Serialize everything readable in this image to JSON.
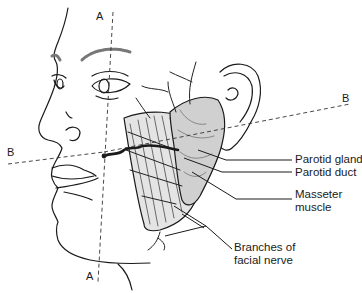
{
  "diagram": {
    "type": "anatomical-illustration",
    "reference_lines": [
      {
        "id": "A",
        "label_top": "A",
        "label_bottom": "A",
        "orientation": "vertical"
      },
      {
        "id": "B",
        "label_left": "B",
        "label_right": "B",
        "orientation": "horizontal"
      }
    ],
    "labels": [
      {
        "id": "parotid-gland",
        "text": "Parotid gland"
      },
      {
        "id": "parotid-duct",
        "text": "Parotid duct"
      },
      {
        "id": "masseter",
        "lines": [
          "Masseter",
          "muscle"
        ]
      },
      {
        "id": "facial-nerve",
        "lines": [
          "Branches of",
          "facial nerve"
        ]
      }
    ]
  }
}
